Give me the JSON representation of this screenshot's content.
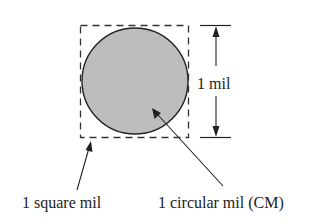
{
  "diagram": {
    "dimension_label": "1 mil",
    "square_label": "1 square mil",
    "circle_label": "1 circular mil (CM)",
    "colors": {
      "circle_fill": "#bdbdbd",
      "stroke": "#222222",
      "background": "#ffffff"
    }
  }
}
